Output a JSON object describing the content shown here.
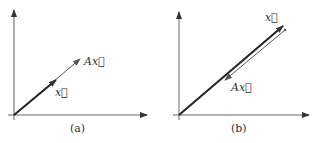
{
  "figure": {
    "panels": [
      {
        "id": "a",
        "caption": "(a)",
        "vector_x_label": "x⃗",
        "vector_ax_label": "Ax⃗",
        "description": "Ax points in the same direction as x and is longer (eigenvalue > 1)"
      },
      {
        "id": "b",
        "caption": "(b)",
        "vector_x_label": "x⃗",
        "vector_ax_label": "Ax⃗",
        "description": "Ax points in the opposite direction of x along the same line (negative eigenvalue)"
      }
    ],
    "colors": {
      "axis": "#555555",
      "vector": "#222222",
      "ax_vector": "#666666"
    }
  }
}
